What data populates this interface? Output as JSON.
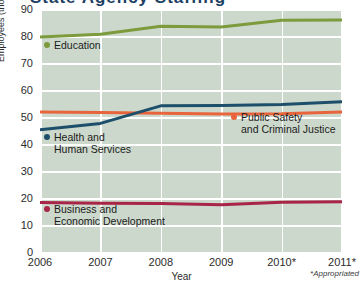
{
  "chart_data": {
    "type": "line",
    "title": "",
    "xlabel": "Year",
    "ylabel": "Employees (thousands)",
    "x": [
      "2006",
      "2007",
      "2008",
      "2009",
      "2010*",
      "2011*"
    ],
    "xtick_labels": [
      "2006",
      "2007",
      "2008",
      "2009",
      "2010*",
      "2011*"
    ],
    "ytick_labels": [
      "90",
      "80",
      "70",
      "60",
      "50",
      "40",
      "30",
      "20",
      "10",
      "0"
    ],
    "ylim": [
      0,
      90
    ],
    "ytick_step": 10,
    "grid": true,
    "legend_position": "inline-labels",
    "footnote": "*Appropriated",
    "plot_background": "#ccd8cb",
    "gridline_color": "#ffffff",
    "series": [
      {
        "name": "Education",
        "color": "#7d9b3c",
        "values": [
          80.0,
          81.0,
          84.0,
          83.7,
          86.2,
          86.3
        ],
        "label_lines": [
          "Education"
        ]
      },
      {
        "name": "Public Safety and Criminal Justice",
        "color": "#e8643c",
        "values": [
          52.2,
          52.0,
          51.8,
          51.5,
          51.6,
          52.2
        ],
        "label_lines": [
          "Public Safety",
          "and Criminal Justice"
        ]
      },
      {
        "name": "Health and Human Services",
        "color": "#1d4f6b",
        "values": [
          45.6,
          48.0,
          54.5,
          54.6,
          55.0,
          56.0
        ],
        "label_lines": [
          "Health and",
          "Human Services"
        ]
      },
      {
        "name": "Business and Economic Development",
        "color": "#a82548",
        "values": [
          18.7,
          18.4,
          18.3,
          17.9,
          18.8,
          19.0
        ],
        "label_lines": [
          "Business and",
          "Economic Development"
        ]
      }
    ]
  },
  "legends": [
    {
      "name": "education",
      "line1": "Education",
      "line2": "",
      "color": "#7d9b3c",
      "left": 44,
      "top": 38
    },
    {
      "name": "health-human-services",
      "line1": "Health and",
      "line2": "Human Services",
      "color": "#1d4f6b",
      "left": 44,
      "top": 130
    },
    {
      "name": "public-safety-criminal-justice",
      "line1": "Public Safety",
      "line2": "and Criminal Justice",
      "color": "#e8643c",
      "left": 231,
      "top": 110
    },
    {
      "name": "business-economic-development",
      "line1": "Business and",
      "line2": "Economic Development",
      "color": "#a82548",
      "left": 44,
      "top": 202
    }
  ],
  "title_sliver": {
    "ghost_text": "State Agency Staffing"
  }
}
